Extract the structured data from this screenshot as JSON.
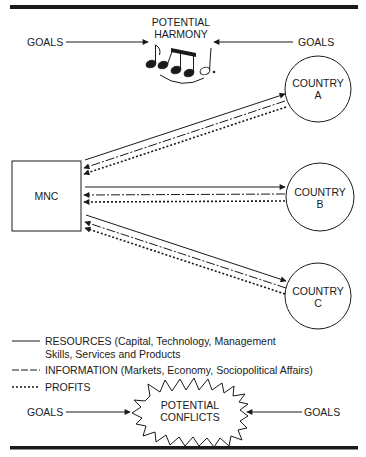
{
  "diagram": {
    "harmony": {
      "title_line1": "POTENTIAL",
      "title_line2": "HARMONY",
      "goals_left": "GOALS",
      "goals_right": "GOALS",
      "icon": "music-notes-icon"
    },
    "mnc": {
      "label": "MNC"
    },
    "countries": [
      {
        "line1": "COUNTRY",
        "line2": "A"
      },
      {
        "line1": "COUNTRY",
        "line2": "B"
      },
      {
        "line1": "COUNTRY",
        "line2": "C"
      }
    ],
    "legend": [
      {
        "style": "solid",
        "line1": "RESOURCES (Capital, Technology, Management",
        "line2": "Skills, Services and Products"
      },
      {
        "style": "dashed",
        "line1": "INFORMATION (Markets, Economy, Sociopolitical Affairs)"
      },
      {
        "style": "dotted-cross",
        "line1": "PROFITS"
      }
    ],
    "conflicts": {
      "title_line1": "POTENTIAL",
      "title_line2": "CONFLICTS",
      "goals_left": "GOALS",
      "goals_right": "GOALS",
      "icon": "starburst-icon"
    },
    "colors": {
      "ink": "#1a1a1a",
      "background": "#ffffff"
    }
  }
}
